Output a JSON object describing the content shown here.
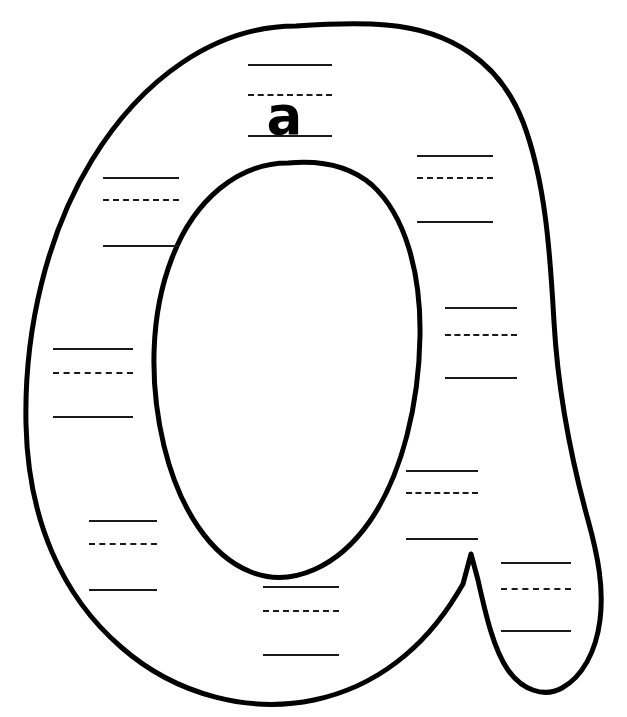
{
  "page": {
    "background_color": "#ffffff",
    "outline_color": "#000000",
    "rule_color": "#1a1a1a",
    "width": 627,
    "height": 717
  },
  "letter_shape": {
    "name": "lowercase-letter-a-outline",
    "character": "a",
    "style": "hollow-bubble-outline",
    "stroke_width": 5
  },
  "model_letter": {
    "character": "a",
    "position": "top-center-guide"
  },
  "guide_groups": [
    {
      "id": "guide-top-center",
      "label": "model-letter-guide",
      "x": 248,
      "y": 64,
      "width": 84,
      "solid_top_y": 0,
      "dashed_mid_y": 30,
      "solid_bottom_y": 71,
      "has_model_letter": true
    },
    {
      "id": "guide-left-upper",
      "label": "practice-guide",
      "x": 103,
      "y": 177,
      "width": 76,
      "solid_top_y": 0,
      "dashed_mid_y": 22,
      "solid_bottom_y": 68,
      "has_model_letter": false
    },
    {
      "id": "guide-right-upper",
      "label": "practice-guide",
      "x": 417,
      "y": 155,
      "width": 76,
      "solid_top_y": 0,
      "dashed_mid_y": 22,
      "solid_bottom_y": 66,
      "has_model_letter": false
    },
    {
      "id": "guide-left-middle",
      "label": "practice-guide",
      "x": 53,
      "y": 348,
      "width": 80,
      "solid_top_y": 0,
      "dashed_mid_y": 24,
      "solid_bottom_y": 68,
      "has_model_letter": false
    },
    {
      "id": "guide-right-middle",
      "label": "practice-guide",
      "x": 445,
      "y": 307,
      "width": 72,
      "solid_top_y": 0,
      "dashed_mid_y": 27,
      "solid_bottom_y": 70,
      "has_model_letter": false
    },
    {
      "id": "guide-left-lower",
      "label": "practice-guide",
      "x": 89,
      "y": 520,
      "width": 68,
      "solid_top_y": 0,
      "dashed_mid_y": 23,
      "solid_bottom_y": 69,
      "has_model_letter": false
    },
    {
      "id": "guide-right-lower",
      "label": "practice-guide",
      "x": 406,
      "y": 470,
      "width": 72,
      "solid_top_y": 0,
      "dashed_mid_y": 22,
      "solid_bottom_y": 68,
      "has_model_letter": false
    },
    {
      "id": "guide-bottom-center",
      "label": "practice-guide",
      "x": 263,
      "y": 586,
      "width": 76,
      "solid_top_y": 0,
      "dashed_mid_y": 24,
      "solid_bottom_y": 68,
      "has_model_letter": false
    },
    {
      "id": "guide-tail",
      "label": "practice-guide",
      "x": 501,
      "y": 562,
      "width": 70,
      "solid_top_y": 0,
      "dashed_mid_y": 26,
      "solid_bottom_y": 68,
      "has_model_letter": false
    }
  ]
}
